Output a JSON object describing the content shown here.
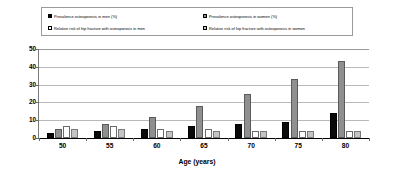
{
  "chart_data": {
    "type": "bar",
    "title": "",
    "xlabel": "Age (years)",
    "ylabel": "",
    "categories": [
      "50",
      "55",
      "60",
      "65",
      "70",
      "75",
      "80"
    ],
    "ylim": [
      0,
      50
    ],
    "yticks": [
      0,
      10,
      20,
      30,
      40,
      50
    ],
    "grid": true,
    "legend_position": "top",
    "series": [
      {
        "name": "Prevalence osteoporosis in men (%)",
        "color": "#000000",
        "values": [
          3,
          4,
          5,
          7,
          8,
          9,
          14
        ]
      },
      {
        "name": "Prevalence osteoporosis in women (%)",
        "color": "#8f8f8f",
        "values": [
          5,
          8,
          12,
          18,
          25,
          33,
          43
        ]
      },
      {
        "name": "Relative risk of hip fracture with osteoporosis in men",
        "color": "#ffffff",
        "values": [
          7,
          7,
          5,
          5,
          4,
          4,
          4
        ]
      },
      {
        "name": "Relative risk of hip fracture with osteoporosis in women",
        "color": "#c4c4c4",
        "values": [
          5,
          5,
          4,
          4,
          4,
          4,
          4
        ]
      }
    ]
  },
  "legend": {
    "items": [
      {
        "label": "Prevalence osteoporosis in men (%)",
        "swatch": "men-prev"
      },
      {
        "label": "Prevalence osteoporosis in women (%)",
        "swatch": "women-prev"
      },
      {
        "label": "Relative risk of hip fracture with osteoporosis in men",
        "swatch": "men-rr"
      },
      {
        "label": "Relative risk of hip fracture with osteoporosis in women",
        "swatch": "women-rr"
      }
    ]
  },
  "axis": {
    "y_tick_labels": [
      "0",
      "10",
      "20",
      "30",
      "40",
      "50"
    ],
    "x_tick_labels": [
      "50",
      "55",
      "60",
      "65",
      "70",
      "75",
      "80"
    ],
    "x_title": "Age (years)"
  }
}
